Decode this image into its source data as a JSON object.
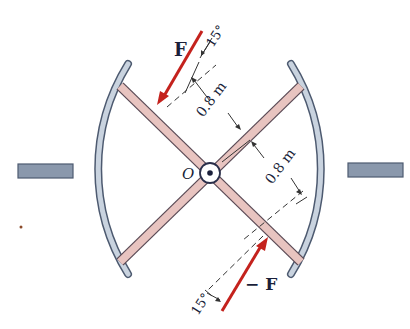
{
  "diagram": {
    "labels": {
      "force_top": "F",
      "force_bottom": "− F",
      "angle_top": "15°",
      "angle_bottom": "15°",
      "dist_upper": "0.8 m",
      "dist_lower": "0.8 m",
      "pivot": "O"
    },
    "colors": {
      "arm_fill": "#e8c4c0",
      "arm_stroke": "#5a4a55",
      "shoe_fill": "#c9d3df",
      "shoe_stroke": "#4d5a70",
      "mount_fill": "#8a98ac",
      "force_color": "#c4221d",
      "text_color": "#1a1f3a"
    },
    "components": [
      "cross-arm-1",
      "cross-arm-2",
      "left-shoe",
      "right-shoe",
      "left-mount",
      "right-mount",
      "pivot-pin"
    ]
  }
}
